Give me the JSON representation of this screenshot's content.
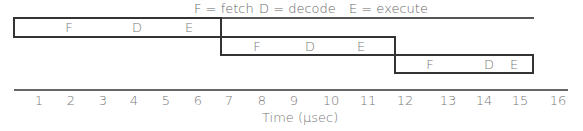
{
  "legend": {
    "fetch": "F = fetch",
    "decode": "D = decode",
    "execute": "E = execute"
  },
  "instructions": [
    {
      "stages": [
        "F",
        "D",
        "E"
      ],
      "start": 0,
      "end": 6.6
    },
    {
      "stages": [
        "F",
        "D",
        "E"
      ],
      "start": 6.6,
      "end": 12.1
    },
    {
      "stages": [
        "F",
        "D",
        "E"
      ],
      "start": 12.1,
      "end": 16.5
    }
  ],
  "axis": {
    "ticks": [
      "1",
      "2",
      "3",
      "4",
      "5",
      "6",
      "7",
      "8",
      "9",
      "10",
      "11",
      "12",
      "13",
      "14",
      "15",
      "16"
    ],
    "label": "Time (μsec)"
  },
  "colors": {
    "line": "#333333",
    "text": "#777777"
  }
}
